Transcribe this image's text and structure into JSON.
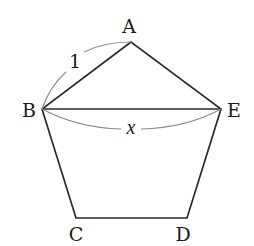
{
  "figure": {
    "type": "regular pentagon with diagonal",
    "vertices": [
      {
        "label": "A",
        "x": 131,
        "y": 42,
        "label_x": 129,
        "label_y": 33
      },
      {
        "label": "B",
        "x": 42,
        "y": 109,
        "label_x": 29,
        "label_y": 117
      },
      {
        "label": "C",
        "x": 76,
        "y": 218,
        "label_x": 76,
        "label_y": 241
      },
      {
        "label": "D",
        "x": 187,
        "y": 218,
        "label_x": 183,
        "label_y": 241
      },
      {
        "label": "E",
        "x": 221,
        "y": 109,
        "label_x": 234,
        "label_y": 117
      }
    ],
    "edges": [
      [
        "A",
        "B"
      ],
      [
        "B",
        "C"
      ],
      [
        "C",
        "D"
      ],
      [
        "D",
        "E"
      ],
      [
        "E",
        "A"
      ]
    ],
    "diagonals": [
      [
        "B",
        "E"
      ]
    ],
    "measurements": [
      {
        "segment": "AB",
        "label": "1",
        "label_x": 75,
        "label_y": 68
      },
      {
        "segment": "BE",
        "label": "x",
        "label_x": 131,
        "label_y": 133
      }
    ]
  }
}
